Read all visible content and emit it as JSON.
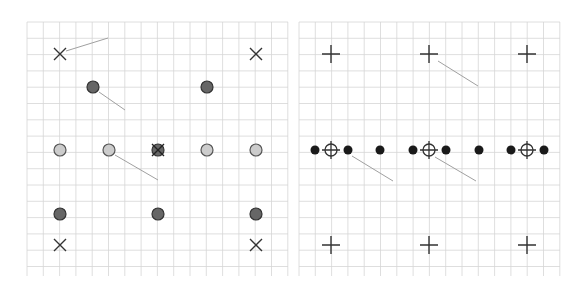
{
  "figure": {
    "width": 586,
    "height": 285,
    "background": "#ffffff",
    "grid_color": "#d6d6d6",
    "grid_spacing": 16.3,
    "colors": {
      "dark_dot_fill": "#666666",
      "dark_dot_stroke": "#333333",
      "light_dot_fill": "#cccccc",
      "light_dot_stroke": "#555555",
      "black_dot": "#1a1a1a",
      "marker_stroke": "#333333",
      "leader_line": "#a0a0a0"
    }
  },
  "panels": [
    {
      "id": "left",
      "grid": {
        "x": 27,
        "y": 22,
        "width": 261,
        "height": 254
      },
      "markers": [
        {
          "type": "cross",
          "x": 60,
          "y": 54
        },
        {
          "type": "cross",
          "x": 256,
          "y": 54
        },
        {
          "type": "dark-dot",
          "x": 93,
          "y": 87
        },
        {
          "type": "dark-dot",
          "x": 207,
          "y": 87
        },
        {
          "type": "light-dot",
          "x": 60,
          "y": 150
        },
        {
          "type": "light-dot",
          "x": 109,
          "y": 150
        },
        {
          "type": "dark-dot-cross",
          "x": 158,
          "y": 150
        },
        {
          "type": "light-dot",
          "x": 207,
          "y": 150
        },
        {
          "type": "light-dot",
          "x": 256,
          "y": 150
        },
        {
          "type": "dark-dot",
          "x": 60,
          "y": 214
        },
        {
          "type": "dark-dot",
          "x": 158,
          "y": 214
        },
        {
          "type": "dark-dot",
          "x": 256,
          "y": 214
        },
        {
          "type": "cross",
          "x": 60,
          "y": 245
        },
        {
          "type": "cross",
          "x": 256,
          "y": 245
        }
      ],
      "leaders": [
        {
          "x1": 66,
          "y1": 51,
          "x2": 108,
          "y2": 38
        },
        {
          "x1": 99,
          "y1": 92,
          "x2": 125,
          "y2": 110
        },
        {
          "x1": 115,
          "y1": 155,
          "x2": 158,
          "y2": 180
        }
      ]
    },
    {
      "id": "right",
      "grid": {
        "x": 299,
        "y": 22,
        "width": 261,
        "height": 254
      },
      "markers": [
        {
          "type": "plus",
          "x": 331,
          "y": 54
        },
        {
          "type": "plus",
          "x": 429,
          "y": 54
        },
        {
          "type": "plus",
          "x": 527,
          "y": 54
        },
        {
          "type": "black-dot",
          "x": 315,
          "y": 150
        },
        {
          "type": "target",
          "x": 331,
          "y": 150
        },
        {
          "type": "black-dot",
          "x": 348,
          "y": 150
        },
        {
          "type": "black-dot",
          "x": 380,
          "y": 150
        },
        {
          "type": "black-dot",
          "x": 413,
          "y": 150
        },
        {
          "type": "target",
          "x": 429,
          "y": 150
        },
        {
          "type": "black-dot",
          "x": 446,
          "y": 150
        },
        {
          "type": "black-dot",
          "x": 479,
          "y": 150
        },
        {
          "type": "black-dot",
          "x": 511,
          "y": 150
        },
        {
          "type": "target",
          "x": 527,
          "y": 150
        },
        {
          "type": "black-dot",
          "x": 544,
          "y": 150
        },
        {
          "type": "plus",
          "x": 331,
          "y": 245
        },
        {
          "type": "plus",
          "x": 429,
          "y": 245
        },
        {
          "type": "plus",
          "x": 527,
          "y": 245
        }
      ],
      "leaders": [
        {
          "x1": 438,
          "y1": 61,
          "x2": 478,
          "y2": 86
        },
        {
          "x1": 352,
          "y1": 156,
          "x2": 393,
          "y2": 181
        },
        {
          "x1": 435,
          "y1": 157,
          "x2": 476,
          "y2": 181
        }
      ]
    }
  ]
}
